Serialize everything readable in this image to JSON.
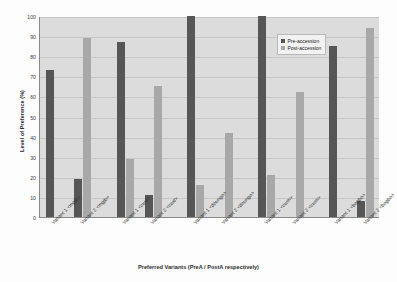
{
  "chart_data": {
    "type": "bar",
    "title": "",
    "xlabel": "Preferred Variants (PreA / PostA respectively)",
    "ylabel": "Level of Preference (%)",
    "ylim": [
      0,
      100
    ],
    "ytick_step": 10,
    "yticks": [
      "100",
      "90",
      "80",
      "70",
      "60",
      "50",
      "40",
      "30",
      "20",
      "10",
      "0"
    ],
    "grid": true,
    "legend_position": "top-right",
    "categories": [
      "Variant 1 <mgjb>",
      "Variant 2 <mgjb>",
      "Variant 1 <cwd>",
      "Variant 2 <cwd>",
      "Variant 1 <doungo>",
      "Variant 2 <doungo>",
      "Variant 1 <cwm>",
      "Variant 2 <cwm>",
      "Variant 1 <bogbo>",
      "Variant 2 <bogbo>"
    ],
    "series": [
      {
        "name": "Pre-accession",
        "color": "#565656",
        "values": [
          73,
          19,
          87,
          11,
          100,
          0,
          100,
          0,
          85,
          8
        ]
      },
      {
        "name": "Post-accession",
        "color": "#a8a8a8",
        "values": [
          0,
          89,
          29,
          65,
          16,
          42,
          21,
          62,
          0,
          94
        ]
      }
    ]
  },
  "legend": {
    "items": [
      {
        "label": "Pre-accession"
      },
      {
        "label": "Post-accession"
      }
    ]
  },
  "colors": {
    "pre_accession": "#565656",
    "post_accession": "#a8a8a8",
    "plot_background": "#dcdcdc",
    "gridline": "#c6c6c6",
    "axis": "#8a8a8a"
  }
}
